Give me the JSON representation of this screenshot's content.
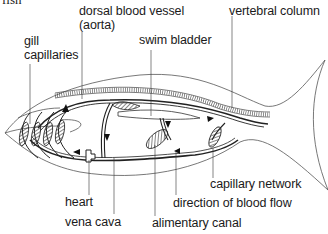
{
  "figure": {
    "title": "fish",
    "colors": {
      "line": "#2a2a2a",
      "background": "#ffffff"
    }
  },
  "labels": {
    "dorsal_vessel_line1": "dorsal blood vessel",
    "dorsal_vessel_line2": "(aorta)",
    "vertebral_column": "vertebral column",
    "gill_line1": "gill",
    "gill_line2": "capillaries",
    "swim_bladder": "swim bladder",
    "capillary_network": "capillary network",
    "heart": "heart",
    "direction_of_blood_flow": "direction of blood flow",
    "vena_cava": "vena cava",
    "alimentary_canal": "alimentary canal"
  }
}
